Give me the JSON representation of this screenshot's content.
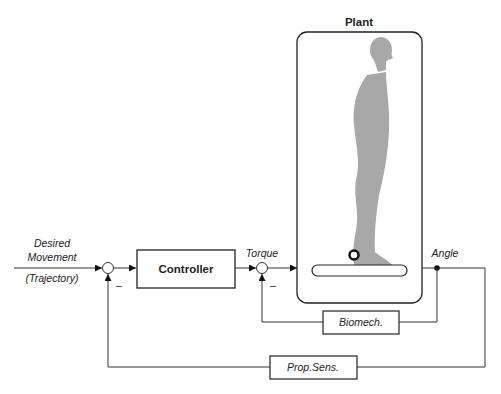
{
  "diagram": {
    "type": "feedback-control-block-diagram",
    "plant": {
      "title": "Plant"
    },
    "input": {
      "line1": "Desired",
      "line2": "Movement",
      "line3": "(Trajectory)"
    },
    "controller": {
      "label": "Controller"
    },
    "torque": {
      "label": "Torque"
    },
    "angle": {
      "label": "Angle"
    },
    "biomech": {
      "label": "Biomech."
    },
    "propsens": {
      "label": "Prop.Sens."
    },
    "sum1": {
      "sign": "–"
    },
    "sum2": {
      "sign": "–"
    },
    "colors": {
      "line": "#333333",
      "figure": "#a8a8a8"
    }
  }
}
